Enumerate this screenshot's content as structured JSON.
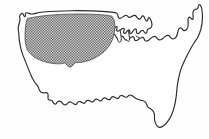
{
  "figure": {
    "background_color": "#ffffff",
    "outline_color": "#2a2a2a",
    "hatch_color": "#3a3a3a",
    "hatch_style": "checkerboard-stipple"
  },
  "regions": [
    {
      "name": "hatched-region",
      "label": "Shaded interior region",
      "pattern": "checkerboard",
      "coverage": "north-central and western interior states",
      "fill_color": "#3a3a3a"
    },
    {
      "name": "unhatched-region",
      "label": "Unshaded remainder",
      "pattern": "none",
      "coverage": "southern, southeastern and northeastern states",
      "fill_color": "#ffffff"
    }
  ],
  "features": [
    {
      "name": "national-outline",
      "label": "United States national border"
    },
    {
      "name": "great-lakes",
      "label": "Great Lakes"
    },
    {
      "name": "florida-peninsula",
      "label": "Florida peninsula"
    },
    {
      "name": "maine-coast",
      "label": "Maine and New England coast"
    },
    {
      "name": "pacific-coast",
      "label": "Pacific coast"
    },
    {
      "name": "gulf-coast",
      "label": "Gulf of Mexico coast"
    },
    {
      "name": "canada-border",
      "label": "Northern border"
    },
    {
      "name": "mexico-border",
      "label": "Southern border"
    }
  ],
  "legend": {
    "visible": false,
    "entries": []
  },
  "annotations": [],
  "axes": {
    "visible": false
  }
}
